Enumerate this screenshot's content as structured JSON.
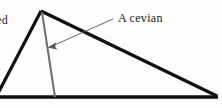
{
  "figure": {
    "type": "geometry-diagram",
    "background_color": "#fdfdfd",
    "stroke_color": "#111111",
    "cevian_color": "#6e6e6e",
    "leader_color": "#555555",
    "text_color": "#1c1c1c"
  },
  "labels": {
    "cevian": "A cevian",
    "truncated_left": "ed"
  },
  "geometry": {
    "apex": {
      "x": 41,
      "y": 11
    },
    "right_vertex": {
      "x": 216,
      "y": 96
    },
    "base_left": {
      "x": 0,
      "y": 97
    },
    "left_side_exit": {
      "x": 0,
      "y": 75
    },
    "cevian_foot": {
      "x": 55,
      "y": 96
    },
    "arrow_tip": {
      "x": 48,
      "y": 47
    },
    "leader_start": {
      "x": 113,
      "y": 19
    },
    "side_stroke_width": 3.2,
    "base_stroke_width": 3.4,
    "cevian_stroke_width": 2.0,
    "leader_stroke_width": 0.9
  }
}
